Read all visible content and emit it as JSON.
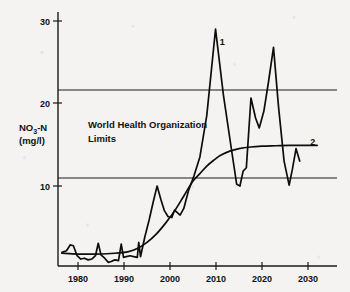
{
  "chart_data": {
    "type": "line",
    "title": "",
    "xlabel": "",
    "ylabel_line1": "NO",
    "ylabel_sub": "3",
    "ylabel_line1b": "-N",
    "ylabel_line2": "(mg/l)",
    "xlim": [
      1976,
      2034
    ],
    "ylim": [
      0,
      31
    ],
    "grid": false,
    "x_ticks": [
      1980,
      1990,
      2000,
      2010,
      2020,
      2030
    ],
    "x_tick_labels": [
      "1980",
      "1990",
      "2000",
      "2010",
      "2020",
      "2030"
    ],
    "y_ticks": [
      10,
      20,
      30
    ],
    "y_tick_labels": [
      "10",
      "20",
      "30"
    ],
    "annotations": [
      {
        "name": "who-limits-label",
        "line1": "World Health Organization",
        "line2": "Limits",
        "x": 1986.5,
        "y": 18.0
      }
    ],
    "reference_lines": [
      {
        "name": "who-upper-limit",
        "value": 21.6,
        "label": ""
      },
      {
        "name": "who-lower-limit",
        "value": 11.0,
        "label": ""
      }
    ],
    "series": [
      {
        "name": "1",
        "label": "1",
        "label_x": 2010.8,
        "label_y": 27.0,
        "description": "measured nitrate concentration",
        "x": [
          1976.5,
          1977.5,
          1978.3,
          1979.0,
          1979.8,
          1980.6,
          1981.4,
          1982.2,
          1983.0,
          1983.8,
          1984.4,
          1985.0,
          1985.8,
          1986.6,
          1987.2,
          1988.0,
          1988.8,
          1989.4,
          1989.9,
          1990.5,
          1991.3,
          1992.1,
          1992.9,
          1993.2,
          1993.6,
          1994.5,
          1995.5,
          1996.4,
          1997.2,
          1998.0,
          1998.8,
          1999.6,
          2000.4,
          2001.0,
          2001.6,
          2002.2,
          2003.0,
          2004.0,
          2005.2,
          2006.5,
          2008.0,
          2009.9,
          2011.6,
          2013.2,
          2014.5,
          2015.2,
          2015.9,
          2016.6,
          2017.6,
          2018.6,
          2019.4,
          2020.4,
          2021.4,
          2022.5,
          2023.6,
          2024.8,
          2025.9,
          2026.6,
          2027.4,
          2028.2
        ],
        "y": [
          2.0,
          2.2,
          2.9,
          2.8,
          1.6,
          1.2,
          1.3,
          1.1,
          1.2,
          1.6,
          3.1,
          1.7,
          1.3,
          0.8,
          0.9,
          1.1,
          1.0,
          3.0,
          1.4,
          1.5,
          1.6,
          1.5,
          1.4,
          3.2,
          1.5,
          3.8,
          6.0,
          8.2,
          10.0,
          8.4,
          7.0,
          6.3,
          6.2,
          7.1,
          6.8,
          6.5,
          7.3,
          9.4,
          11.2,
          13.5,
          18.5,
          28.9,
          21.0,
          15.0,
          10.2,
          10.0,
          11.8,
          12.2,
          20.6,
          18.2,
          17.0,
          19.0,
          22.5,
          26.7,
          19.5,
          13.0,
          10.1,
          12.0,
          14.5,
          13.0
        ]
      },
      {
        "name": "2",
        "label": "2",
        "label_x": 2030.5,
        "label_y": 14.9,
        "description": "modelled trend / projection",
        "x": [
          1976.5,
          1980.0,
          1984.0,
          1988.0,
          1991.0,
          1993.0,
          1995.0,
          1997.0,
          1999.0,
          2001.0,
          2003.0,
          2005.0,
          2006.5,
          2008.0,
          2009.5,
          2011.0,
          2013.0,
          2015.0,
          2017.5,
          2020.0,
          2023.0,
          2026.0,
          2029.0,
          2032.0
        ],
        "y": [
          1.9,
          1.8,
          1.8,
          1.9,
          2.1,
          2.5,
          3.2,
          4.2,
          5.5,
          7.0,
          8.8,
          10.6,
          11.5,
          12.4,
          13.1,
          13.7,
          14.2,
          14.5,
          14.7,
          14.8,
          14.85,
          14.9,
          14.9,
          14.9
        ]
      }
    ]
  }
}
